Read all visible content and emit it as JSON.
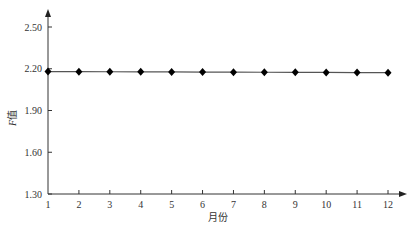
{
  "chart_data": {
    "type": "line",
    "title": "",
    "xlabel": "月份",
    "ylabel": "F值",
    "x": [
      1,
      2,
      3,
      4,
      5,
      6,
      7,
      8,
      9,
      10,
      11,
      12
    ],
    "categories": [
      "1",
      "2",
      "3",
      "4",
      "5",
      "6",
      "7",
      "8",
      "9",
      "10",
      "11",
      "12"
    ],
    "series": [
      {
        "name": "F值",
        "values": [
          2.18,
          2.18,
          2.18,
          2.18,
          2.18,
          2.18,
          2.18,
          2.18,
          2.18,
          2.18,
          2.18,
          2.18
        ],
        "marker": "diamond",
        "color": "#000000"
      }
    ],
    "ylim": [
      1.3,
      2.6
    ],
    "yticks": [
      "1.30",
      "1.60",
      "1.90",
      "2.20",
      "2.50"
    ],
    "grid": false,
    "legend": "none"
  },
  "axes": {
    "x_title": "月份",
    "y_title_italic": "F",
    "y_title_rest": "值"
  }
}
